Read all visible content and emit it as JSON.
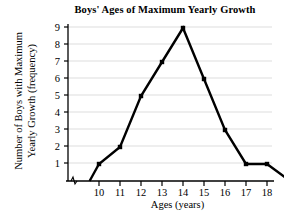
{
  "chart_data": {
    "type": "line",
    "title": "Boys' Ages of Maximum Yearly Growth",
    "xlabel": "Ages (years)",
    "ylabel_line1": "Number of Boys with Maximum",
    "ylabel_line2": "Yearly Growth (frequency)",
    "categories": [
      10,
      11,
      12,
      13,
      14,
      15,
      16,
      17,
      18
    ],
    "values": [
      1,
      2,
      5,
      7,
      9,
      6,
      3,
      1,
      1
    ],
    "x": [
      10,
      11,
      12,
      13,
      14,
      15,
      16,
      17,
      18
    ],
    "y": [
      1,
      2,
      5,
      7,
      9,
      6,
      3,
      1,
      1
    ],
    "series": [
      {
        "name": "Boys with maximum yearly growth",
        "values": [
          1,
          2,
          5,
          7,
          9,
          6,
          3,
          1,
          1
        ]
      }
    ],
    "xtick_labels": [
      "10",
      "11",
      "12",
      "13",
      "14",
      "15",
      "16",
      "17",
      "18"
    ],
    "ytick_labels": [
      "1",
      "2",
      "3",
      "4",
      "5",
      "6",
      "7",
      "8",
      "9"
    ],
    "ytick_values": [
      1,
      2,
      3,
      4,
      5,
      6,
      7,
      8,
      9
    ],
    "xlim": [
      9.3,
      19.3
    ],
    "ylim": [
      0,
      9.6
    ],
    "grid": "horizontal",
    "grid_color": "#e8e8e8",
    "line_color": "#000000",
    "marker": "square",
    "marker_color": "#000000",
    "legend": "none",
    "axis_break": "zigzag-near-origin",
    "leading_segment": {
      "from_x": 9.55,
      "from_y": 0,
      "to_x": 10,
      "to_y": 1
    },
    "trailing_segment": {
      "from_x": 18,
      "from_y": 1,
      "to_x": 19.1,
      "to_y": 0
    },
    "annotations": []
  }
}
